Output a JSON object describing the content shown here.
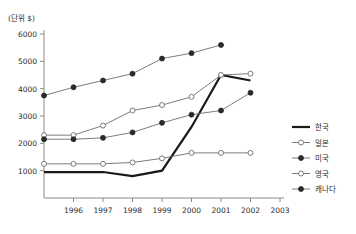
{
  "chart_data": {
    "type": "line",
    "title": "",
    "subtitle": "",
    "unit_label": "(단위 $)",
    "xlabel": "",
    "ylabel": "",
    "grid": false,
    "legend_position": "right",
    "x": [
      1995,
      1996,
      1997,
      1998,
      1999,
      2000,
      2001,
      2002,
      2003
    ],
    "xtick_labels": [
      "1996",
      "1997",
      "1998",
      "1999",
      "2000",
      "2001",
      "2002",
      "2003"
    ],
    "xtick_values": [
      1996,
      1997,
      1998,
      1999,
      2000,
      2001,
      2002,
      2003
    ],
    "xlim": [
      1995,
      2003
    ],
    "ytick_labels": [
      "1000",
      "2000",
      "3000",
      "4000",
      "5000",
      "6000"
    ],
    "ytick_values": [
      1000,
      2000,
      3000,
      4000,
      5000,
      6000
    ],
    "ylim": [
      0,
      6000
    ],
    "series": [
      {
        "name": "한국",
        "marker": "none",
        "style": "thick-solid",
        "color": "#1a1a1a",
        "x": [
          1995,
          1996,
          1997,
          1998,
          1999,
          2000,
          2001,
          2002
        ],
        "values": [
          950,
          950,
          950,
          800,
          1000,
          2600,
          4500,
          4300
        ]
      },
      {
        "name": "일본",
        "marker": "open-circle",
        "style": "thin-solid",
        "color": "#6e6e6e",
        "x": [
          1995,
          1996,
          1997,
          1998,
          1999,
          2000,
          2001,
          2002
        ],
        "values": [
          2300,
          2300,
          2650,
          3200,
          3400,
          3700,
          4500,
          4550
        ]
      },
      {
        "name": "미국",
        "marker": "filled-circle",
        "style": "thin-solid",
        "color": "#2a2a2a",
        "x": [
          1995,
          1996,
          1997,
          1998,
          1999,
          2000,
          2001
        ],
        "values": [
          3750,
          4050,
          4300,
          4550,
          5100,
          5300,
          5600
        ]
      },
      {
        "name": "영국",
        "marker": "open-circle",
        "style": "thin-solid",
        "color": "#6e6e6e",
        "x": [
          1995,
          1996,
          1997,
          1998,
          1999,
          2000,
          2001,
          2002
        ],
        "values": [
          1250,
          1250,
          1250,
          1300,
          1450,
          1650,
          1650,
          1650
        ]
      },
      {
        "name": "캐나다",
        "marker": "filled-circle",
        "style": "thin-solid",
        "color": "#2a2a2a",
        "x": [
          1995,
          1996,
          1997,
          1998,
          1999,
          2000,
          2001,
          2002
        ],
        "values": [
          2150,
          2150,
          2200,
          2400,
          2750,
          3050,
          3200,
          3850
        ]
      }
    ]
  },
  "legend": {
    "items": [
      {
        "label": "한국"
      },
      {
        "label": "일본"
      },
      {
        "label": "미국"
      },
      {
        "label": "영국"
      },
      {
        "label": "캐나다"
      }
    ]
  }
}
